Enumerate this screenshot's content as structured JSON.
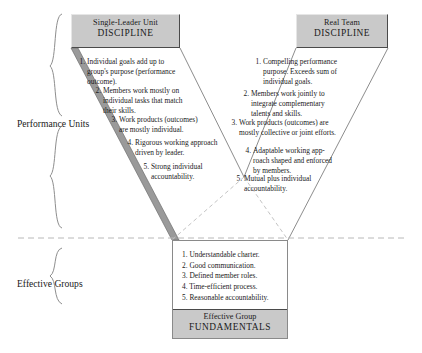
{
  "diagram": {
    "title_left": {
      "line1": "Single-Leader Unit",
      "line2": "DISCIPLINE"
    },
    "title_right": {
      "line1": "Real Team",
      "line2": "DISCIPLINE"
    },
    "brace_labels": {
      "performance_units": "Performance Units",
      "effective_groups": "Effective Groups"
    },
    "left_arm": [
      {
        "num": "1.",
        "text": "Individual goals add up to group's purpose (performance outcome)."
      },
      {
        "num": "2.",
        "text": "Members work mostly on individual tasks that match their skills."
      },
      {
        "num": "3.",
        "text": "Work products (outcomes) are mostly individual."
      },
      {
        "num": "4.",
        "text": "Rigorous working approach driven by leader."
      },
      {
        "num": "5.",
        "text": "Strong individual accountability."
      }
    ],
    "right_arm": [
      {
        "num": "1.",
        "text": "Compelling performance purpose. Exceeds sum of individual goals."
      },
      {
        "num": "2.",
        "text": "Members work jointly to integrate complementary talents and skills."
      },
      {
        "num": "3.",
        "text": "Work products (outcomes) are mostly collective or joint efforts."
      },
      {
        "num": "4.",
        "text": "Adaptable working app-roach shaped and enforced by members."
      },
      {
        "num": "5.",
        "text": "Mutual plus individual accountability."
      }
    ],
    "fundamentals": {
      "items": [
        "1. Understandable charter.",
        "2. Good communication.",
        "3. Defined member roles.",
        "4. Time-efficient process.",
        "5. Reasonable accountability."
      ],
      "footer": {
        "line1": "Effective Group",
        "line2": "FUNDAMENTALS"
      }
    },
    "colors": {
      "header_fill": "#c9c9c9",
      "header_border": "#4a4a4a",
      "arm_shade": "#9a9a9a",
      "line": "#555555",
      "dashed": "#bdbdbd"
    }
  }
}
